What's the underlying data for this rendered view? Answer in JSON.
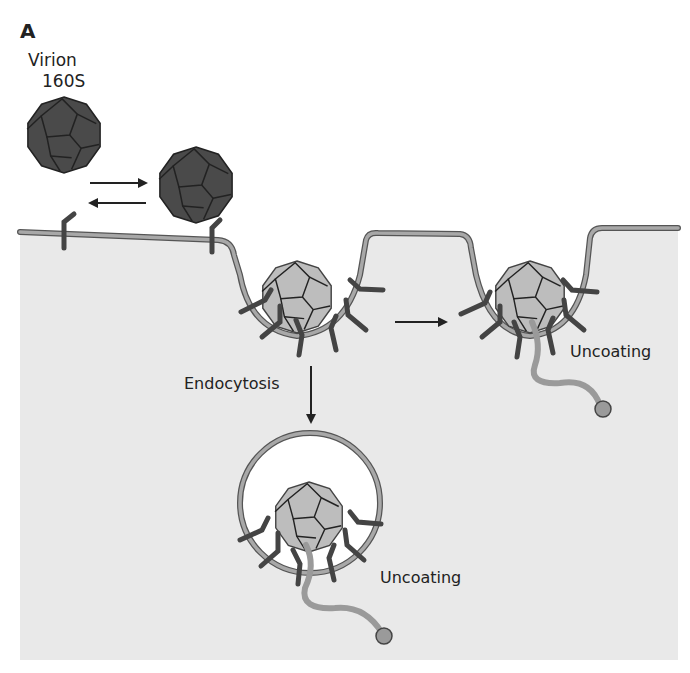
{
  "figure": {
    "panel_label": "A",
    "virion_label_line1": "Virion",
    "virion_label_line2": "160S",
    "endocytosis_label": "Endocytosis",
    "uncoating_label_pit": "Uncoating",
    "uncoating_label_vesicle": "Uncoating"
  },
  "colors": {
    "background": "#ffffff",
    "cytoplasm": "#e9e9e9",
    "membrane_fill": "#a8a8a8",
    "membrane_stroke": "#555555",
    "virion_dark": "#4a4a4a",
    "virion_light": "#bdbdbd",
    "receptor": "#444444",
    "rna": "#9a9a9a",
    "vesicle_lumen": "#ffffff"
  }
}
